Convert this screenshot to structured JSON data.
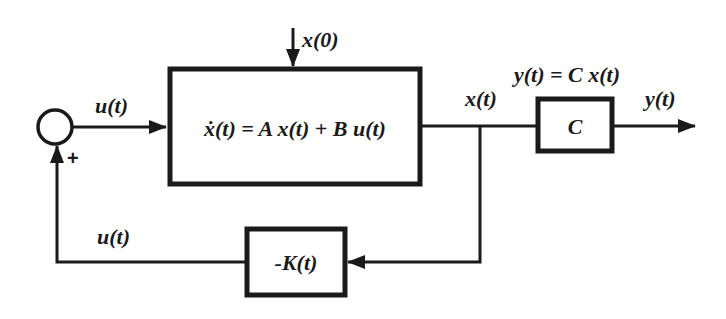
{
  "diagram": {
    "type": "state-feedback block diagram",
    "summing_junction": {
      "input_sign": "+"
    },
    "labels": {
      "initial_state": "x(0)",
      "input_top": "u(t)",
      "input_feedback": "u(t)",
      "state": "x(t)",
      "output": "y(t)",
      "output_equation": "y(t) = C x(t)"
    },
    "blocks": {
      "plant": "ẋ(t) = A x(t) + B u(t)",
      "output_matrix": "C",
      "gain": "-K(t)"
    },
    "colors": {
      "stroke": "#1a1a1a",
      "background": "#ffffff"
    }
  }
}
